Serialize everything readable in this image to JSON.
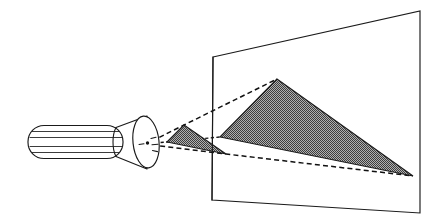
{
  "figure": {
    "background_color": "#ffffff",
    "line_color": "#1a1a1a",
    "fill_gray": "#808080",
    "dash_color": "#111111"
  },
  "projector": {
    "label": "projector-device",
    "barrel": {
      "label": "barrel",
      "x": 28,
      "y": 125.5,
      "width": 95,
      "height": 33,
      "corner_radius": 16,
      "interior_lines": 4
    },
    "cone": {
      "label": "lens-cone",
      "points": "116,127 146,116 146,170 116,157"
    },
    "lens_ellipse": {
      "label": "lens-ellipse",
      "cx": 146,
      "cy": 142,
      "rx": 13,
      "ry": 26,
      "rotation": -6
    },
    "center_of_projection": {
      "cx": 148,
      "cy": 143,
      "r": 1.6
    }
  },
  "image_plane": {
    "label": "image-plane",
    "corners": {
      "top_left": {
        "x": 213,
        "y": 57
      },
      "top_right": {
        "x": 420,
        "y": 11
      },
      "bottom_right": {
        "x": 420,
        "y": 213
      },
      "bottom_left": {
        "x": 212,
        "y": 200
      }
    },
    "polygon": "213,57 420,11 420,213 212,200"
  },
  "object_triangle": {
    "label": "source-triangle-small",
    "fill": "#808080",
    "vertices": {
      "apex": {
        "x": 184,
        "y": 125
      },
      "left": {
        "x": 167,
        "y": 142
      },
      "right": {
        "x": 226,
        "y": 154
      }
    },
    "polygon": "184,125 167,142 226,154"
  },
  "projected_triangle": {
    "label": "projected-triangle-large",
    "fill": "#808080",
    "vertices": {
      "apex": {
        "x": 277,
        "y": 79
      },
      "left": {
        "x": 220,
        "y": 137
      },
      "right": {
        "x": 413,
        "y": 176
      }
    },
    "polygon": "277,79 220,137 413,176"
  },
  "projection_rays": [
    {
      "label": "ray-to-apex",
      "from": {
        "x": 152,
        "y": 141
      },
      "through": {
        "x": 184,
        "y": 125
      },
      "to": {
        "x": 277,
        "y": 79
      }
    },
    {
      "label": "ray-to-right-vertex",
      "from": {
        "x": 152,
        "y": 145
      },
      "through": {
        "x": 226,
        "y": 154
      },
      "to": {
        "x": 413,
        "y": 176
      }
    },
    {
      "label": "ray-to-left-vertex",
      "from": {
        "x": 152,
        "y": 143
      },
      "through": {
        "x": 167,
        "y": 142
      },
      "to": {
        "x": 220,
        "y": 137
      }
    }
  ],
  "light_marks": {
    "label": "emission-tick-marks",
    "count": 4
  }
}
